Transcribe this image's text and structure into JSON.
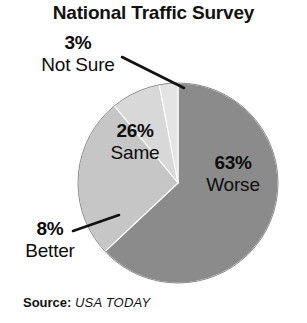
{
  "chart_data": {
    "type": "pie",
    "title": "National Traffic Survey",
    "xlabel": "",
    "ylabel": "",
    "grid": false,
    "legend_position": "none",
    "labels_inside_slices": [
      "26% Same",
      "63% Worse"
    ],
    "labels_outside_slices": [
      "3% Not Sure",
      "8% Better"
    ],
    "start_angle_deg": 0,
    "direction": "clockwise",
    "categories": [
      "Worse",
      "Same",
      "Better",
      "Not Sure"
    ],
    "values": [
      63,
      26,
      8,
      3
    ],
    "units": "percent",
    "slices": [
      {
        "name": "Worse",
        "percent": 63,
        "percent_text": "63%",
        "color": "#8b8b8b",
        "label_placement": "inside"
      },
      {
        "name": "Same",
        "percent": 26,
        "percent_text": "26%",
        "color": "#c6c6c6",
        "label_placement": "inside"
      },
      {
        "name": "Better",
        "percent": 8,
        "percent_text": "8%",
        "color": "#d8d8d8",
        "label_placement": "outside-leader"
      },
      {
        "name": "Not Sure",
        "percent": 3,
        "percent_text": "3%",
        "color": "#e4e4e4",
        "label_placement": "outside-leader"
      }
    ]
  },
  "title": "National Traffic Survey",
  "slice_labels": {
    "not_sure": {
      "percent": "3%",
      "name": "Not Sure"
    },
    "same": {
      "percent": "26%",
      "name": "Same"
    },
    "worse": {
      "percent": "63%",
      "name": "Worse"
    },
    "better": {
      "percent": "8%",
      "name": "Better"
    }
  },
  "source": {
    "label": "Source:",
    "value": "USA TODAY"
  },
  "colors": {
    "worse": "#8b8b8b",
    "same": "#c6c6c6",
    "better": "#d8d8d8",
    "not_sure": "#e4e4e4",
    "outline": "#8a8a8a",
    "leader": "#111111",
    "text": "#111111",
    "background": "#ffffff"
  }
}
